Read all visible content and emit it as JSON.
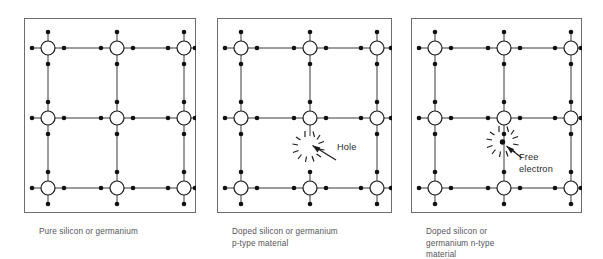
{
  "figure": {
    "background_color": "#ffffff",
    "frame_color": "#6d6d6d",
    "bond_color": "#3a3a3a",
    "atom_fill": "#ffffff",
    "atom_stroke": "#1a1a1a",
    "electron_color": "#111111",
    "caption_color": "#55545a",
    "label_color": "#2b2b2b"
  },
  "panels": [
    {
      "id": "pure",
      "caption": "Pure silicon or germanium",
      "lattice": {
        "rows": 3,
        "cols": 3,
        "atom_radius": 7,
        "electron_dot_radius": 2.2,
        "atoms_x": [
          48,
          117,
          184
        ],
        "atoms_y": [
          48,
          118,
          188
        ]
      },
      "annotation": null
    },
    {
      "id": "p-type",
      "caption": "Doped silicon or germanium\np-type material",
      "lattice": {
        "rows": 3,
        "cols": 3,
        "atom_radius": 7,
        "electron_dot_radius": 2.2,
        "atoms_x": [
          241,
          310,
          377
        ],
        "atoms_y": [
          48,
          118,
          188
        ]
      },
      "annotation": {
        "type": "hole",
        "label": "Hole",
        "has_center_dot": false,
        "burst_center_x": 305,
        "burst_center_y": 142,
        "arrow_from_x": 336,
        "arrow_from_y": 160,
        "arrow_to_x": 312,
        "arrow_to_y": 145
      }
    },
    {
      "id": "n-type",
      "caption": "Doped silicon or\ngermanium n-type\nmaterial",
      "lattice": {
        "rows": 3,
        "cols": 3,
        "atom_radius": 7,
        "electron_dot_radius": 2.2,
        "atoms_x": [
          434,
          503,
          570
        ],
        "atoms_y": [
          48,
          118,
          188
        ]
      },
      "annotation": {
        "type": "free-electron",
        "label": "Free\nelectron",
        "has_center_dot": true,
        "burst_center_x": 503,
        "burst_center_y": 140,
        "arrow_from_x": 523,
        "arrow_from_y": 158,
        "arrow_to_x": 508,
        "arrow_to_y": 144
      }
    }
  ]
}
